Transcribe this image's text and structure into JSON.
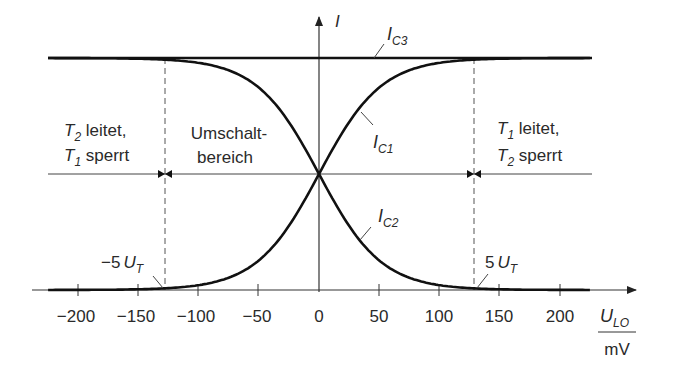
{
  "axes": {
    "y_label": "I",
    "x_label_num": "U",
    "x_label_sub": "LO",
    "x_label_den": "mV",
    "x_ticks": [
      {
        "value": -200,
        "label": "−200"
      },
      {
        "value": -150,
        "label": "−150"
      },
      {
        "value": -100,
        "label": "−100"
      },
      {
        "value": -50,
        "label": "−50"
      },
      {
        "value": 0,
        "label": "0"
      },
      {
        "value": 50,
        "label": "50"
      },
      {
        "value": 100,
        "label": "100"
      },
      {
        "value": 150,
        "label": "150"
      },
      {
        "value": 200,
        "label": "200"
      }
    ]
  },
  "curves": {
    "ic3": {
      "main": "I",
      "sub": "C3"
    },
    "ic1": {
      "main": "I",
      "sub": "C1"
    },
    "ic2": {
      "main": "I",
      "sub": "C2"
    }
  },
  "regions": {
    "left": {
      "line1_main": "T",
      "line1_sub": "2",
      "line1_text": " leitet,",
      "line2_main": "T",
      "line2_sub": "1",
      "line2_text": " sperrt"
    },
    "middle": {
      "line1": "Umschalt-",
      "line2": "bereich"
    },
    "right": {
      "line1_main": "T",
      "line1_sub": "1",
      "line1_text": " leitet,",
      "line2_main": "T",
      "line2_sub": "2",
      "line2_text": " sperrt"
    }
  },
  "markers": {
    "left": {
      "prefix": "−5",
      "main": "U",
      "sub": "T"
    },
    "right": {
      "prefix": "5",
      "main": "U",
      "sub": "T"
    }
  },
  "colors": {
    "curve": "#111111",
    "axis": "#333333",
    "dashed": "#555555",
    "text": "#2a2a2a"
  },
  "chart_data": {
    "type": "line",
    "title": "",
    "xlabel": "U_LO / mV",
    "ylabel": "I",
    "xlim": [
      -225,
      225
    ],
    "x_ticks": [
      -200,
      -150,
      -100,
      -50,
      0,
      50,
      100,
      150,
      200
    ],
    "series": [
      {
        "name": "I_C3",
        "description": "constant tail current",
        "x": [
          -225,
          225
        ],
        "values": [
          1,
          1
        ]
      },
      {
        "name": "I_C1",
        "description": "I_C3 / (1 + exp(-U_LO/U_T))",
        "x": [
          -225,
          -130,
          -100,
          -50,
          0,
          50,
          100,
          130,
          225
        ],
        "values": [
          0.0,
          0.006,
          0.02,
          0.13,
          0.5,
          0.87,
          0.98,
          0.994,
          1.0
        ]
      },
      {
        "name": "I_C2",
        "description": "I_C3 / (1 + exp(U_LO/U_T))",
        "x": [
          -225,
          -130,
          -100,
          -50,
          0,
          50,
          100,
          130,
          225
        ],
        "values": [
          1.0,
          0.994,
          0.98,
          0.87,
          0.5,
          0.13,
          0.02,
          0.006,
          0.0
        ]
      }
    ],
    "annotations": [
      {
        "x": -130,
        "label": "-5 U_T",
        "style": "dashed vertical"
      },
      {
        "x": 130,
        "label": "5 U_T",
        "style": "dashed vertical"
      },
      {
        "region": "x < -5U_T",
        "label": "T2 leitet, T1 sperrt"
      },
      {
        "region": "-5U_T < x < 5U_T",
        "label": "Umschaltbereich"
      },
      {
        "region": "x > 5U_T",
        "label": "T1 leitet, T2 sperrt"
      }
    ],
    "grid": false,
    "legend": "none (inline labels)"
  }
}
